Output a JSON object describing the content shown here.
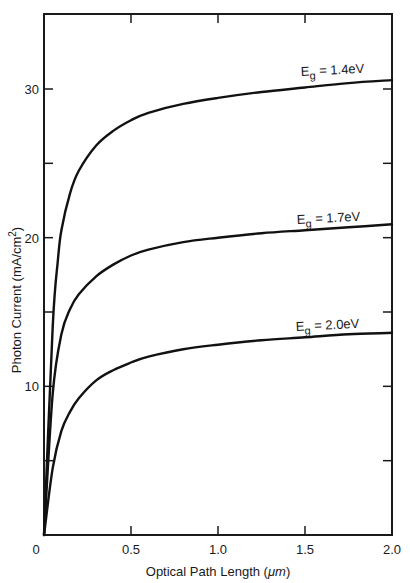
{
  "chart_data": {
    "type": "line",
    "title": "",
    "xlabel": "Optical Path Length (μm)",
    "ylabel": "Photon Current (mA/cm2)",
    "xlim": [
      0,
      2.0
    ],
    "ylim": [
      0,
      35
    ],
    "grid": false,
    "legend": "inline labels at right end of each curve",
    "x_ticks": [
      "0",
      "0.5",
      "1.0",
      "1.5",
      "2.0"
    ],
    "y_ticks": [
      "0",
      "10",
      "20",
      "30"
    ],
    "series": [
      {
        "name": "Eg = 1.4eV",
        "x": [
          0,
          0.05,
          0.08,
          0.1,
          0.15,
          0.2,
          0.3,
          0.4,
          0.5,
          0.6,
          0.8,
          1.0,
          1.25,
          1.5,
          1.75,
          2.0
        ],
        "values": [
          0,
          14,
          18.5,
          20.5,
          23,
          24.5,
          26.2,
          27.2,
          27.9,
          28.4,
          29.0,
          29.4,
          29.8,
          30.1,
          30.4,
          30.6
        ]
      },
      {
        "name": "Eg = 1.7eV",
        "x": [
          0,
          0.05,
          0.1,
          0.15,
          0.2,
          0.3,
          0.4,
          0.5,
          0.6,
          0.8,
          1.0,
          1.25,
          1.5,
          1.75,
          2.0
        ],
        "values": [
          0,
          9.5,
          13.5,
          15.2,
          16.2,
          17.4,
          18.2,
          18.8,
          19.2,
          19.7,
          20.0,
          20.3,
          20.5,
          20.7,
          20.9
        ]
      },
      {
        "name": "Eg = 2.0eV",
        "x": [
          0,
          0.05,
          0.1,
          0.15,
          0.2,
          0.3,
          0.4,
          0.5,
          0.6,
          0.8,
          1.0,
          1.25,
          1.5,
          1.75,
          2.0
        ],
        "values": [
          0,
          4.5,
          7.0,
          8.3,
          9.2,
          10.4,
          11.1,
          11.6,
          12.0,
          12.5,
          12.8,
          13.1,
          13.3,
          13.5,
          13.6
        ]
      }
    ],
    "annotations": [
      "E_g = 1.4eV",
      "E_g = 1.7eV",
      "E_g = 2.0eV"
    ]
  },
  "labels": {
    "xlabel_main": "Optical Path Length (",
    "xlabel_unit": "μm",
    "xlabel_close": ")",
    "ylabel_main": "Photon Current (mA/cm",
    "ylabel_sup": "2",
    "ylabel_close": ")",
    "series": [
      {
        "E": "E",
        "sub": "g",
        "rest": " =  1.4eV"
      },
      {
        "E": "E",
        "sub": "g",
        "rest": " =  1.7eV"
      },
      {
        "E": "E",
        "sub": "g",
        "rest": " =  2.0eV"
      }
    ]
  }
}
